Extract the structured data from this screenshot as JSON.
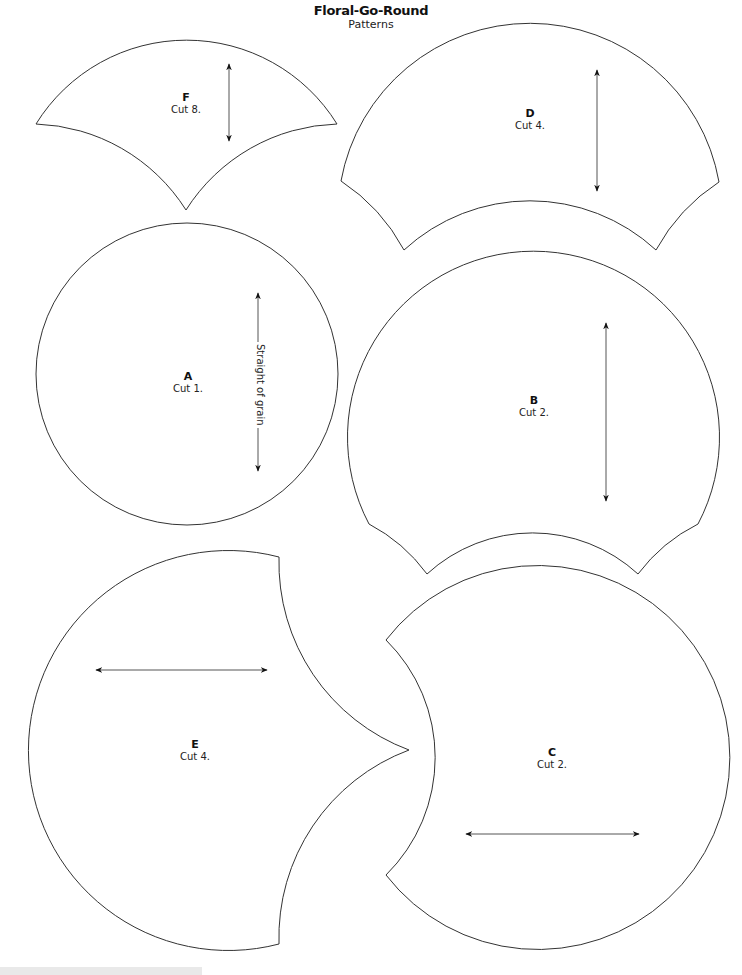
{
  "header": {
    "title": "Floral-Go-Round",
    "subtitle": "Patterns"
  },
  "pieces": [
    {
      "id": "F",
      "letter": "F",
      "cut": "Cut 8.",
      "grain": "vertical"
    },
    {
      "id": "D",
      "letter": "D",
      "cut": "Cut 4.",
      "grain": "vertical"
    },
    {
      "id": "A",
      "letter": "A",
      "cut": "Cut 1.",
      "grain": "vertical",
      "grain_label": "Straight of grain"
    },
    {
      "id": "B",
      "letter": "B",
      "cut": "Cut 2.",
      "grain": "vertical"
    },
    {
      "id": "E",
      "letter": "E",
      "cut": "Cut 4.",
      "grain": "horizontal"
    },
    {
      "id": "C",
      "letter": "C",
      "cut": "Cut 2.",
      "grain": "horizontal"
    }
  ],
  "colors": {
    "outline": "#333333",
    "background": "#ffffff",
    "footer_bar": "#e9e9e9"
  }
}
